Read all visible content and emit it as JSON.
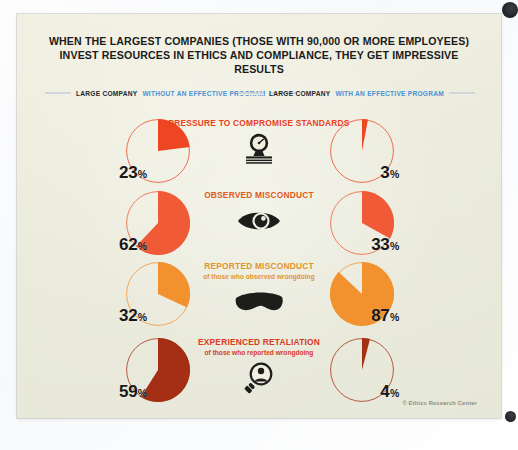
{
  "poster": {
    "headline": "WHEN THE LARGEST COMPANIES (THOSE WITH 90,000 OR MORE EMPLOYEES) INVEST RESOURCES IN ETHICS AND COMPLIANCE, THEY GET IMPRESSIVE RESULTS",
    "credit": "© Ethics Research Center",
    "legend": {
      "left_prefix": "LARGE COMPANY",
      "left_highlight": "WITHOUT AN EFFECTIVE PROGRAM",
      "right_prefix": "LARGE COMPANY",
      "right_highlight": "WITH AN EFFECTIVE PROGRAM",
      "highlight_color": "#4b92d6"
    }
  },
  "chart_data": {
    "type": "pie",
    "title": "WHEN THE LARGEST COMPANIES (THOSE WITH 90,000 OR MORE EMPLOYEES) INVEST RESOURCES IN ETHICS AND COMPLIANCE, THEY GET IMPRESSIVE RESULTS",
    "units": "percent",
    "legend_position": "top",
    "series": [
      {
        "name": "LARGE COMPANY WITHOUT AN EFFECTIVE PROGRAM",
        "values": [
          23,
          62,
          32,
          59
        ]
      },
      {
        "name": "LARGE COMPANY WITH AN EFFECTIVE PROGRAM",
        "values": [
          3,
          33,
          87,
          4
        ]
      }
    ],
    "categories": [
      "PRESSURE TO COMPROMISE STANDARDS",
      "OBSERVED MISCONDUCT",
      "REPORTED MISCONDUCT",
      "EXPERIENCED RETALIATION"
    ],
    "rows": [
      {
        "caption": "PRESSURE TO COMPROMISE STANDARDS",
        "subcaption": "",
        "icon": "gauge-icon",
        "caption_color": "#e8401f",
        "slice_color": "#ee4523",
        "left": {
          "value": 23,
          "label": "23",
          "unit": "%"
        },
        "right": {
          "value": 3,
          "label": "3",
          "unit": "%"
        }
      },
      {
        "caption": "OBSERVED MISCONDUCT",
        "subcaption": "",
        "icon": "eye-icon",
        "caption_color": "#e05a20",
        "slice_color": "#f05a36",
        "left": {
          "value": 62,
          "label": "62",
          "unit": "%"
        },
        "right": {
          "value": 33,
          "label": "33",
          "unit": "%"
        }
      },
      {
        "caption": "REPORTED MISCONDUCT",
        "subcaption": "of those who observed wrongdoing",
        "icon": "mask-icon",
        "caption_color": "#e2952c",
        "slice_color": "#f2922f",
        "left": {
          "value": 32,
          "label": "32",
          "unit": "%"
        },
        "right": {
          "value": 87,
          "label": "87",
          "unit": "%"
        }
      },
      {
        "caption": "EXPERIENCED RETALIATION",
        "subcaption": "of those who reported wrongdoing",
        "icon": "magnifier-person-icon",
        "caption_color": "#d83a1c",
        "slice_color": "#a52f14",
        "left": {
          "value": 59,
          "label": "59",
          "unit": "%"
        },
        "right": {
          "value": 4,
          "label": "4",
          "unit": "%"
        }
      }
    ]
  }
}
